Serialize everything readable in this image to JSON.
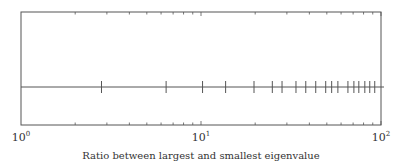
{
  "chart_data": {
    "type": "scatter",
    "title": "",
    "xlabel": "Ratio between largest and smallest eigenvalue",
    "ylabel": "",
    "xscale": "log",
    "xlim": [
      1,
      100
    ],
    "grid": false,
    "legend": null,
    "x_tick_labels": [
      {
        "base": "10",
        "exp": "0",
        "value": 1
      },
      {
        "base": "10",
        "exp": "1",
        "value": 10
      },
      {
        "base": "10",
        "exp": "2",
        "value": 100
      }
    ],
    "marker_style": "vertical-bar",
    "series": [
      {
        "name": "eigenvalue ratios",
        "y": 0,
        "x": [
          2.8,
          6.4,
          10.2,
          13.7,
          19.7,
          24.9,
          28.2,
          33.7,
          38.2,
          43.4,
          49.3,
          53.2,
          57.6,
          65.5,
          70.7,
          75.3,
          81.3,
          86.6,
          92.3
        ]
      }
    ]
  },
  "colors": {
    "frame": "#555555",
    "line": "#555555",
    "marker": "#555555",
    "text": "#333333"
  }
}
